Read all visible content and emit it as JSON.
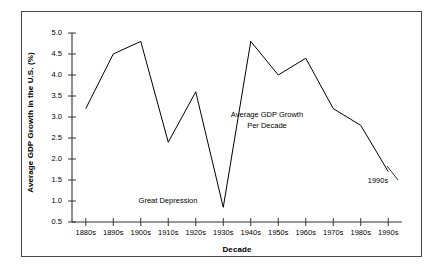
{
  "chart_data": {
    "type": "line",
    "title": "",
    "xlabel": "Decade",
    "ylabel": "Average GDP Growth in the U.S. (%)",
    "categories": [
      "1880s",
      "1890s",
      "1900s",
      "1910s",
      "1920s",
      "1930s",
      "1940s",
      "1950s",
      "1960s",
      "1970s",
      "1980s",
      "1990s"
    ],
    "values": [
      3.2,
      4.5,
      4.8,
      2.4,
      3.6,
      0.85,
      4.8,
      4.0,
      4.4,
      3.2,
      2.8,
      1.7
    ],
    "series": [
      {
        "name": "Average GDP Growth Per Decade",
        "values": [
          3.2,
          4.5,
          4.8,
          2.4,
          3.6,
          0.85,
          4.8,
          4.0,
          4.4,
          3.2,
          2.8,
          1.7
        ]
      }
    ],
    "ylim": [
      0.5,
      5.0
    ],
    "ytick_values": [
      0.5,
      1.0,
      1.5,
      2.0,
      2.5,
      3.0,
      3.5,
      4.0,
      4.5,
      5.0
    ],
    "ytick_labels": [
      "0.5",
      "1.0",
      "1.5",
      "2.0",
      "2.5",
      "3.0",
      "3.5",
      "4.0",
      "4.5",
      "5.0"
    ],
    "xtick_labels": [
      "1880s",
      "1890s",
      "1900s",
      "1910s",
      "1920s",
      "1930s",
      "1940s",
      "1950s",
      "1960s",
      "1970s",
      "1980s",
      "1990s"
    ],
    "grid": false,
    "legend": "none",
    "line_color": "#000000",
    "annotations": [
      {
        "text": "Great Depression",
        "target_category": "1930s",
        "target_value": 0.85
      },
      {
        "text": "Average GDP Growth",
        "target_category": "1940s",
        "target_value": 3.1
      },
      {
        "text": "Per Decade",
        "target_category": "1940s",
        "target_value": 2.9
      },
      {
        "text": "1990s",
        "target_category": "1990s",
        "target_value": 1.7
      }
    ]
  },
  "annotations": {
    "great_depression": "Great Depression",
    "series_label_line1": "Average GDP Growth",
    "series_label_line2": "Per Decade",
    "last_point_label": "1990s"
  },
  "axes": {
    "x_title": "Decade",
    "y_title": "Average GDP Growth in the U.S. (%)"
  },
  "colors": {
    "line": "#000000",
    "axis": "#333333",
    "frame": "#4a4a4a",
    "background": "#ffffff"
  }
}
